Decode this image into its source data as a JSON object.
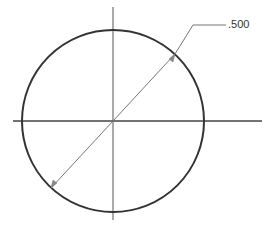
{
  "diagram": {
    "type": "technical-drawing",
    "dimension": {
      "label": ".500",
      "type": "diameter"
    },
    "colors": {
      "outline": "#333333",
      "centerline": "#444444",
      "dimension": "#777777",
      "background": "#ffffff"
    }
  }
}
